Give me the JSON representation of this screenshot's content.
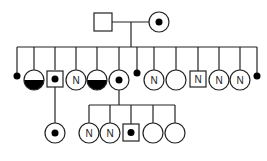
{
  "diagram": {
    "type": "pedigree",
    "colors": {
      "stroke": "#222222",
      "fill": "#000000",
      "background": "#ffffff"
    },
    "generations": [
      {
        "id": "I",
        "individuals": [
          {
            "id": "I-1",
            "sex": "male",
            "status": "unaffected",
            "label": ""
          },
          {
            "id": "I-2",
            "sex": "female",
            "status": "carrier",
            "label": ""
          }
        ]
      },
      {
        "id": "II",
        "individuals": [
          {
            "id": "II-1",
            "sex": "unknown",
            "status": "deceased-small",
            "label": ""
          },
          {
            "id": "II-2",
            "sex": "female",
            "status": "half-filled",
            "label": ""
          },
          {
            "id": "II-3",
            "sex": "male",
            "status": "carrier",
            "label": ""
          },
          {
            "id": "II-4",
            "sex": "female",
            "status": "normal",
            "label": "N"
          },
          {
            "id": "II-5",
            "sex": "female",
            "status": "half-filled",
            "label": ""
          },
          {
            "id": "II-6",
            "sex": "female",
            "status": "carrier",
            "label": ""
          },
          {
            "id": "II-7",
            "sex": "unknown",
            "status": "deceased-small",
            "label": ""
          },
          {
            "id": "II-8",
            "sex": "female",
            "status": "normal",
            "label": "N"
          },
          {
            "id": "II-9",
            "sex": "female",
            "status": "unaffected",
            "label": ""
          },
          {
            "id": "II-10",
            "sex": "male",
            "status": "normal",
            "label": "N"
          },
          {
            "id": "II-11",
            "sex": "female",
            "status": "normal",
            "label": "N"
          },
          {
            "id": "II-12",
            "sex": "female",
            "status": "normal",
            "label": "N"
          },
          {
            "id": "II-13",
            "sex": "unknown",
            "status": "deceased-small",
            "label": ""
          }
        ]
      },
      {
        "id": "III",
        "individuals": [
          {
            "id": "III-1",
            "sex": "female",
            "status": "carrier",
            "label": "",
            "parent": "II-3"
          },
          {
            "id": "III-2",
            "sex": "female",
            "status": "normal",
            "label": "N",
            "parent": "II-6"
          },
          {
            "id": "III-3",
            "sex": "female",
            "status": "normal",
            "label": "N",
            "parent": "II-6"
          },
          {
            "id": "III-4",
            "sex": "male",
            "status": "carrier",
            "label": "",
            "parent": "II-6"
          },
          {
            "id": "III-5",
            "sex": "female",
            "status": "unaffected",
            "label": "",
            "parent": "II-6"
          },
          {
            "id": "III-6",
            "sex": "female",
            "status": "unaffected",
            "label": "",
            "parent": "II-6"
          }
        ]
      }
    ]
  }
}
